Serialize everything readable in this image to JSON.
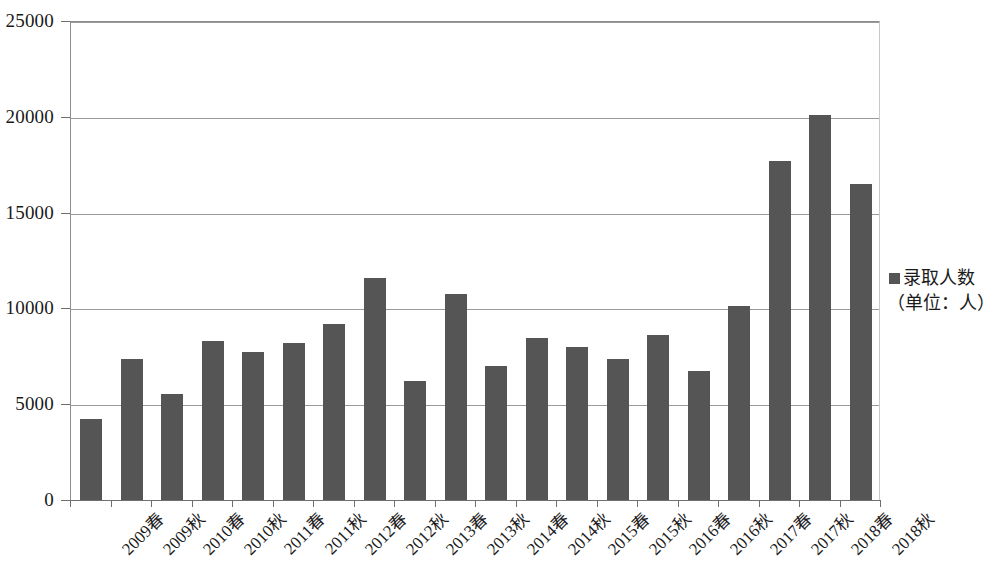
{
  "chart_data": {
    "type": "bar",
    "title": "",
    "subtitle": "",
    "xlabel": "",
    "ylabel": "",
    "ylim": [
      0,
      25000
    ],
    "ytick_values": [
      0,
      5000,
      10000,
      15000,
      20000,
      25000
    ],
    "ytick_labels": [
      "0",
      "5000",
      "10000",
      "15000",
      "20000",
      "25000"
    ],
    "grid": true,
    "legend_position": "right",
    "legend": [
      "录取人数（单位：人）"
    ],
    "legend_lines": [
      "录取人数",
      "（单位：人）"
    ],
    "series_name": "录取人数",
    "series_unit": "（单位：人）",
    "bar_color": "#555555",
    "gridline_color": "#9a9a9a",
    "axis_color": "#6f6f6f",
    "categories": [
      "2009春",
      "2009秋",
      "2010春",
      "2010秋",
      "2011春",
      "2011秋",
      "2012春",
      "2012秋",
      "2013春",
      "2013秋",
      "2014春",
      "2014秋",
      "2015春",
      "2015秋",
      "2016春",
      "2016秋",
      "2017春",
      "2017秋",
      "2018春",
      "2018秋"
    ],
    "values": [
      4270,
      7420,
      5580,
      8370,
      7790,
      8250,
      9260,
      11630,
      6270,
      10790,
      7050,
      8500,
      8050,
      7400,
      8660,
      6790,
      10160,
      17720,
      20160,
      16550
    ]
  }
}
